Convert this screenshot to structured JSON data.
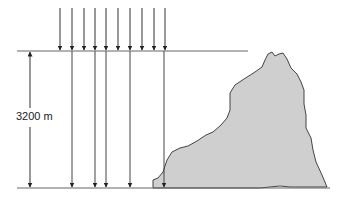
{
  "diagram": {
    "dimension_label": "3200 m",
    "colors": {
      "line": "#555555",
      "rock_fill": "#cfcfcf",
      "rock_stroke": "#444444",
      "arrow": "#333333"
    },
    "top_line": {
      "y": 51,
      "x1": 17,
      "x2": 248
    },
    "ground_line": {
      "y": 188,
      "x1": 17,
      "x2": 330
    },
    "incoming_arrows_x": [
      60,
      72,
      84,
      95,
      106,
      118,
      130,
      142,
      154,
      165
    ],
    "penetrating_arrows_x": [
      72,
      95,
      106,
      130,
      164
    ],
    "dimension_arrow_x": 30
  }
}
